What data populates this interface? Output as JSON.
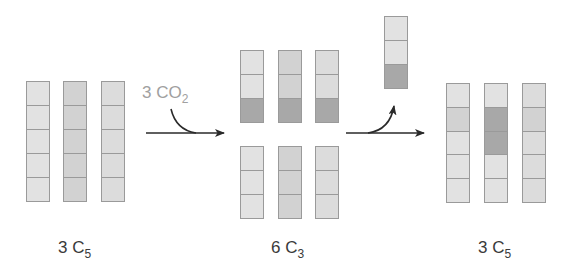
{
  "colors": {
    "light": "#e2e2e2",
    "medium": "#d2d2d2",
    "pale": "#dcdcdc",
    "dark": "#a8a8a8",
    "border": "#9a9a9a",
    "arrow": "#2a2a2a",
    "co2_text": "#a0a0a0",
    "label_text": "#3a3a3a"
  },
  "labels": {
    "left": {
      "count": "3",
      "element": "C",
      "subscript": "5"
    },
    "middle": {
      "count": "6",
      "element": "C",
      "subscript": "3"
    },
    "right": {
      "count": "3",
      "element": "C",
      "subscript": "5"
    },
    "co2": {
      "count": "3",
      "formula": "CO",
      "subscript": "2"
    }
  },
  "groups": {
    "left_c5": [
      {
        "x": 26,
        "y": 81,
        "h": 121,
        "cells": [
          "light",
          "light",
          "light",
          "light",
          "light"
        ]
      },
      {
        "x": 63,
        "y": 81,
        "h": 121,
        "cells": [
          "medium",
          "medium",
          "medium",
          "medium",
          "medium"
        ]
      },
      {
        "x": 101,
        "y": 81,
        "h": 121,
        "cells": [
          "pale",
          "pale",
          "pale",
          "pale",
          "pale"
        ]
      }
    ],
    "middle_c3_top": [
      {
        "x": 240,
        "y": 50,
        "h": 73,
        "cells": [
          "light",
          "light",
          "dark"
        ]
      },
      {
        "x": 278,
        "y": 50,
        "h": 73,
        "cells": [
          "medium",
          "medium",
          "dark"
        ]
      },
      {
        "x": 315,
        "y": 50,
        "h": 73,
        "cells": [
          "pale",
          "pale",
          "dark"
        ]
      }
    ],
    "middle_c3_bottom": [
      {
        "x": 240,
        "y": 146,
        "h": 73,
        "cells": [
          "light",
          "light",
          "light"
        ]
      },
      {
        "x": 278,
        "y": 146,
        "h": 73,
        "cells": [
          "medium",
          "medium",
          "medium"
        ]
      },
      {
        "x": 315,
        "y": 146,
        "h": 73,
        "cells": [
          "pale",
          "pale",
          "pale"
        ]
      }
    ],
    "released_c3": [
      {
        "x": 384,
        "y": 16,
        "h": 73,
        "cells": [
          "light",
          "light",
          "dark"
        ]
      }
    ],
    "right_c5": [
      {
        "x": 446,
        "y": 83,
        "h": 120,
        "cells": [
          "light",
          "medium",
          "light",
          "light",
          "light"
        ]
      },
      {
        "x": 484,
        "y": 83,
        "h": 120,
        "cells": [
          "light",
          "dark",
          "dark",
          "light",
          "light"
        ]
      },
      {
        "x": 522,
        "y": 83,
        "h": 120,
        "cells": [
          "pale",
          "medium",
          "pale",
          "pale",
          "pale"
        ]
      }
    ]
  }
}
